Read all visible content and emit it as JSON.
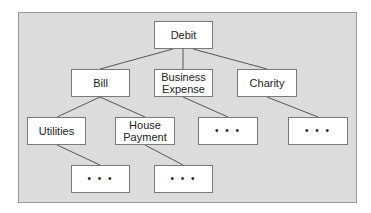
{
  "diagram": {
    "type": "tree",
    "colors": {
      "panel_bg": "#dcdcdc",
      "node_bg": "#ffffff",
      "border": "#7a7a7a",
      "edge": "#555555"
    },
    "nodes": [
      {
        "id": "debit",
        "label": "Debit",
        "x": 154,
        "y": 21,
        "w": 59,
        "h": 28
      },
      {
        "id": "bill",
        "label": "Bill",
        "x": 71,
        "y": 69,
        "w": 59,
        "h": 28
      },
      {
        "id": "business_expense",
        "label": "Business Expense",
        "x": 154,
        "y": 69,
        "w": 59,
        "h": 28
      },
      {
        "id": "charity",
        "label": "Charity",
        "x": 237,
        "y": 69,
        "w": 60,
        "h": 28
      },
      {
        "id": "utilities",
        "label": "Utilities",
        "x": 27,
        "y": 117,
        "w": 59,
        "h": 28
      },
      {
        "id": "house_payment",
        "label": "House Payment",
        "x": 115,
        "y": 117,
        "w": 60,
        "h": 28
      },
      {
        "id": "business_more",
        "label": "• • •",
        "x": 198,
        "y": 117,
        "w": 60,
        "h": 28
      },
      {
        "id": "charity_more",
        "label": "• • •",
        "x": 288,
        "y": 117,
        "w": 60,
        "h": 28
      },
      {
        "id": "utilities_more",
        "label": "• • •",
        "x": 71,
        "y": 165,
        "w": 59,
        "h": 28
      },
      {
        "id": "house_more",
        "label": "• • •",
        "x": 154,
        "y": 165,
        "w": 59,
        "h": 28
      }
    ],
    "edges": [
      {
        "from": "debit",
        "to": "bill",
        "x1": 173,
        "y1": 49,
        "x2": 100,
        "y2": 69
      },
      {
        "from": "debit",
        "to": "business_expense",
        "x1": 183,
        "y1": 49,
        "x2": 183,
        "y2": 69
      },
      {
        "from": "debit",
        "to": "charity",
        "x1": 193,
        "y1": 49,
        "x2": 267,
        "y2": 69
      },
      {
        "from": "bill",
        "to": "utilities",
        "x1": 100,
        "y1": 97,
        "x2": 57,
        "y2": 117
      },
      {
        "from": "bill",
        "to": "house_payment",
        "x1": 100,
        "y1": 97,
        "x2": 145,
        "y2": 117
      },
      {
        "from": "business_expense",
        "to": "business_more",
        "x1": 183,
        "y1": 97,
        "x2": 228,
        "y2": 117
      },
      {
        "from": "charity",
        "to": "charity_more",
        "x1": 267,
        "y1": 97,
        "x2": 318,
        "y2": 117
      },
      {
        "from": "utilities",
        "to": "utilities_more",
        "x1": 57,
        "y1": 145,
        "x2": 100,
        "y2": 165
      },
      {
        "from": "house_payment",
        "to": "house_more",
        "x1": 145,
        "y1": 145,
        "x2": 183,
        "y2": 165
      }
    ]
  },
  "labels": {
    "debit": "Debit",
    "bill": "Bill",
    "business_expense_line1": "Business",
    "business_expense_line2": "Expense",
    "charity": "Charity",
    "utilities": "Utilities",
    "house_payment_line1": "House",
    "house_payment_line2": "Payment",
    "ellipsis": "• • •"
  }
}
